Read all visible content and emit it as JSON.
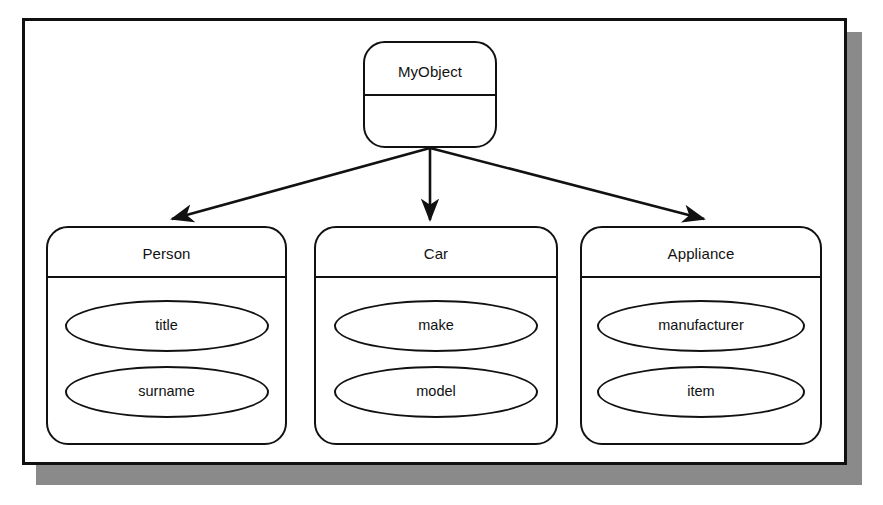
{
  "diagram": {
    "style": {
      "line_color": "#111111",
      "fill_color": "#ffffff",
      "shadow_color": "#8a8a8a",
      "page_background": "#ffffff"
    },
    "root": {
      "name": "MyObject",
      "attributes": []
    },
    "children": [
      {
        "name": "Person",
        "attributes": [
          "title",
          "surname"
        ]
      },
      {
        "name": "Car",
        "attributes": [
          "make",
          "model"
        ]
      },
      {
        "name": "Appliance",
        "attributes": [
          "manufacturer",
          "item"
        ]
      }
    ],
    "connectors": [
      {
        "from": "MyObject",
        "to": "Person",
        "arrowhead": "solid",
        "label": ""
      },
      {
        "from": "MyObject",
        "to": "Car",
        "arrowhead": "solid",
        "label": ""
      },
      {
        "from": "MyObject",
        "to": "Appliance",
        "arrowhead": "solid",
        "label": ""
      }
    ]
  }
}
